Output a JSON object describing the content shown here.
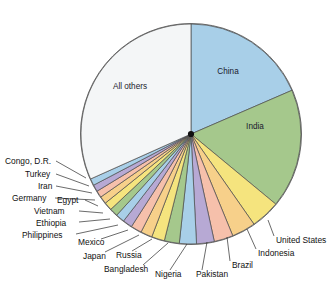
{
  "figure": {
    "name": "world-population-pie-chart",
    "background_color": "#ffffff",
    "outline_color": "#5a5a5a"
  },
  "chart_data": {
    "type": "pie",
    "title": "",
    "subtitle": "",
    "xlabel": "",
    "ylabel": "",
    "legend_position": "none",
    "grid": false,
    "start_angle_deg": 0,
    "direction": "clockwise",
    "units": "share of world population (percent)",
    "categories": [
      "China",
      "India",
      "United States",
      "Indonesia",
      "Brazil",
      "Pakistan",
      "Nigeria",
      "Bangladesh",
      "Russia",
      "Japan",
      "Mexico",
      "Philippines",
      "Ethiopia",
      "Vietnam",
      "Egypt",
      "Germany",
      "Iran",
      "Turkey",
      "Congo, D.R.",
      "All others"
    ],
    "values": [
      18.5,
      17.5,
      4.3,
      3.5,
      2.8,
      2.6,
      2.5,
      2.2,
      1.9,
      1.7,
      1.6,
      1.4,
      1.3,
      1.2,
      1.2,
      1.1,
      1.0,
      1.0,
      1.0,
      31.7
    ],
    "colors": [
      "#a8cfe8",
      "#a5c88c",
      "#f5e47e",
      "#f7d08a",
      "#f6c0ab",
      "#b7a9d4",
      "#a8cfe8",
      "#a5c88c",
      "#f5e47e",
      "#f7d08a",
      "#f6c0ab",
      "#b7a9d4",
      "#a8cfe8",
      "#a5c88c",
      "#f5e47e",
      "#f7d08a",
      "#f6c0ab",
      "#b7a9d4",
      "#a8cfe8",
      "#f4f6f7"
    ]
  },
  "labels": {
    "inside": [
      {
        "name": "slice-label-china",
        "text": "China",
        "x": 228,
        "y": 74
      },
      {
        "name": "slice-label-india",
        "text": "India",
        "x": 255,
        "y": 129
      },
      {
        "name": "slice-label-all-others",
        "text": "All others",
        "x": 130,
        "y": 89
      }
    ],
    "outside": [
      {
        "name": "slice-label-united-states",
        "text": "United States",
        "x": 276,
        "y": 243,
        "anchor": "start",
        "lx1": 268,
        "ly1": 220,
        "lx2": 274,
        "ly2": 236
      },
      {
        "name": "slice-label-indonesia",
        "text": "Indonesia",
        "x": 258,
        "y": 256,
        "anchor": "start",
        "lx1": 247,
        "ly1": 229,
        "lx2": 256,
        "ly2": 249
      },
      {
        "name": "slice-label-brazil",
        "text": "Brazil",
        "x": 232,
        "y": 268,
        "anchor": "start",
        "lx1": 227,
        "ly1": 237,
        "lx2": 230,
        "ly2": 261
      },
      {
        "name": "slice-label-pakistan",
        "text": "Pakistan",
        "x": 196,
        "y": 277,
        "anchor": "start",
        "lx1": 207,
        "ly1": 242,
        "lx2": 202,
        "ly2": 270
      },
      {
        "name": "slice-label-nigeria",
        "text": "Nigeria",
        "x": 155,
        "y": 277,
        "anchor": "start",
        "lx1": 187,
        "ly1": 244,
        "lx2": 170,
        "ly2": 270
      },
      {
        "name": "slice-label-bangladesh",
        "text": "Bangladesh",
        "x": 104,
        "y": 272,
        "anchor": "start",
        "lx1": 168,
        "ly1": 243,
        "lx2": 143,
        "ly2": 265
      },
      {
        "name": "slice-label-russia",
        "text": "Russia",
        "x": 116,
        "y": 258,
        "anchor": "start",
        "lx1": 152,
        "ly1": 239,
        "lx2": 132,
        "ly2": 251
      },
      {
        "name": "slice-label-japan",
        "text": "Japan",
        "x": 83,
        "y": 259,
        "anchor": "start",
        "lx1": 139,
        "ly1": 235,
        "lx2": 105,
        "ly2": 252
      },
      {
        "name": "slice-label-mexico",
        "text": "Mexico",
        "x": 78,
        "y": 245,
        "anchor": "start",
        "lx1": 128,
        "ly1": 230,
        "lx2": 101,
        "ly2": 239
      },
      {
        "name": "slice-label-philippines",
        "text": "Philippines",
        "x": 22,
        "y": 238,
        "anchor": "start",
        "lx1": 118,
        "ly1": 225,
        "lx2": 76,
        "ly2": 234
      },
      {
        "name": "slice-label-ethiopia",
        "text": "Ethiopia",
        "x": 36,
        "y": 226,
        "anchor": "start",
        "lx1": 110,
        "ly1": 219,
        "lx2": 79,
        "ly2": 222
      },
      {
        "name": "slice-label-vietnam",
        "text": "Vietnam",
        "x": 34,
        "y": 214,
        "anchor": "start",
        "lx1": 103,
        "ly1": 213,
        "lx2": 79,
        "ly2": 211
      },
      {
        "name": "slice-label-egypt",
        "text": "Egypt",
        "x": 57,
        "y": 203,
        "anchor": "start",
        "lx1": 98,
        "ly1": 206,
        "lx2": 85,
        "ly2": 200
      },
      {
        "name": "slice-label-germany",
        "text": "Germany",
        "x": 12,
        "y": 201,
        "anchor": "start",
        "lx1": 95,
        "ly1": 200,
        "lx2": 55,
        "ly2": 198
      },
      {
        "name": "slice-label-iran",
        "text": "Iran",
        "x": 38,
        "y": 189,
        "anchor": "start",
        "lx1": 92,
        "ly1": 193,
        "lx2": 56,
        "ly2": 186
      },
      {
        "name": "slice-label-turkey",
        "text": "Turkey",
        "x": 25,
        "y": 177,
        "anchor": "start",
        "lx1": 89,
        "ly1": 186,
        "lx2": 56,
        "ly2": 174
      },
      {
        "name": "slice-label-congo-dr",
        "text": "Congo, D.R.",
        "x": 5,
        "y": 164,
        "anchor": "start",
        "lx1": 86,
        "ly1": 178,
        "lx2": 56,
        "ly2": 161
      }
    ]
  }
}
